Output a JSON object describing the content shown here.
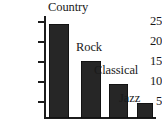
{
  "chart_data": {
    "type": "bar",
    "title": "",
    "xlabel": "",
    "ylabel": "",
    "categories": [
      "Country",
      "Rock",
      "Classical",
      "Jazz"
    ],
    "values": [
      25,
      15,
      9,
      4
    ],
    "ylim": [
      0,
      27
    ],
    "yticks": [
      5,
      10,
      15,
      20,
      25
    ],
    "ytick_labels": [
      "5",
      "10",
      "15",
      "20",
      "25"
    ],
    "grid": false,
    "legend": "none",
    "bar_color": "#262626",
    "axis_color": "#1c1c1c",
    "background_color": "#ffffff",
    "label_placement": "above-right-of-bar"
  }
}
